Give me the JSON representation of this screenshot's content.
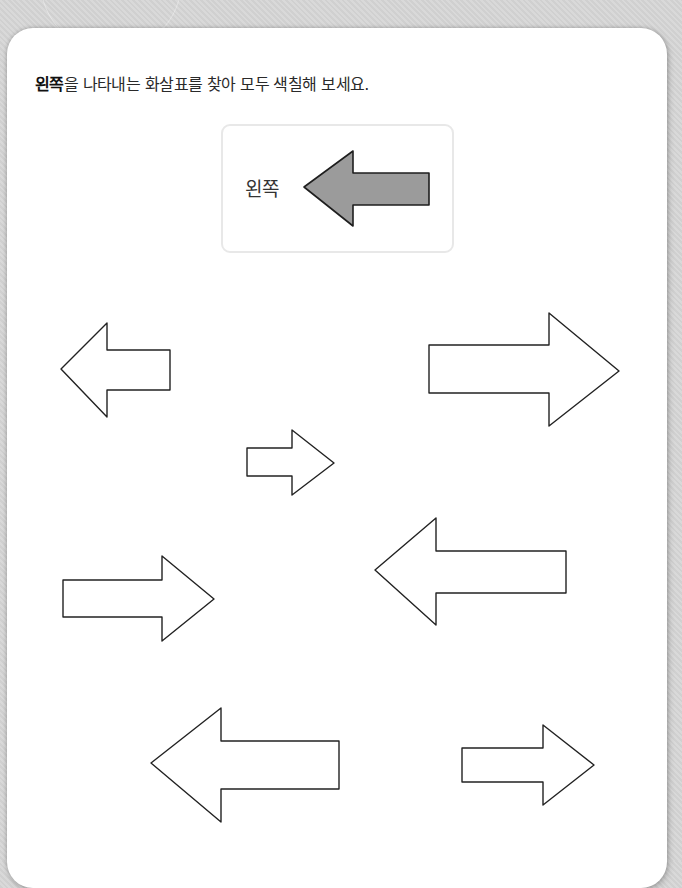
{
  "instruction": {
    "bold_text": "왼쪽",
    "rest_text": "을 나타내는 화살표를 찾아 모두 색칠해 보세요."
  },
  "example": {
    "label": "왼쪽",
    "arrow_direction": "left",
    "arrow_fill": "#9b9b9b"
  },
  "colors": {
    "background": "#d7d7d7",
    "card": "#ffffff",
    "arrow_stroke": "#222222",
    "example_box_border": "#e8e8e8"
  },
  "arrows": [
    {
      "id": 1,
      "direction": "left",
      "filled": false
    },
    {
      "id": 2,
      "direction": "right",
      "filled": false
    },
    {
      "id": 3,
      "direction": "right",
      "filled": false
    },
    {
      "id": 4,
      "direction": "right",
      "filled": false
    },
    {
      "id": 5,
      "direction": "left",
      "filled": false
    },
    {
      "id": 6,
      "direction": "left",
      "filled": false
    },
    {
      "id": 7,
      "direction": "right",
      "filled": false
    }
  ]
}
